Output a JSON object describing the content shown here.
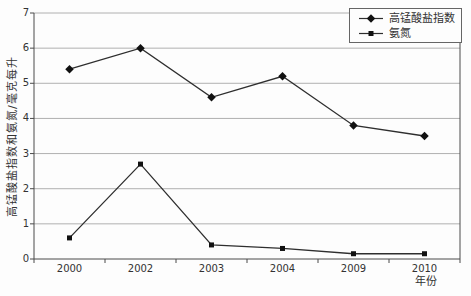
{
  "chart_data": {
    "type": "line",
    "title": "",
    "categories": [
      "2000",
      "2002",
      "2003",
      "2004",
      "2009",
      "2010"
    ],
    "series": [
      {
        "name": "高锰酸盐指数",
        "marker": "diamond",
        "values": [
          5.4,
          6.0,
          4.6,
          5.2,
          3.8,
          3.5
        ]
      },
      {
        "name": "氨氮",
        "marker": "square",
        "values": [
          0.6,
          2.7,
          0.4,
          0.3,
          0.15,
          0.15
        ]
      }
    ],
    "xlabel": "年份",
    "ylabel": "高锰酸盐指数和氨氮/毫克每升",
    "ylim": [
      0,
      7
    ],
    "yticks": [
      "0",
      "1",
      "2",
      "3",
      "4",
      "5",
      "6",
      "7"
    ],
    "grid": "horizontal",
    "legend_position": "top-right",
    "colors": {
      "series_line": "#2e2e2e",
      "marker_fill": "#111111",
      "grid_line": "#b0b0b0",
      "axis_line": "#4a4a4a",
      "text": "#333333",
      "background": "#fdfdfd",
      "legend_border": "#666666"
    }
  }
}
